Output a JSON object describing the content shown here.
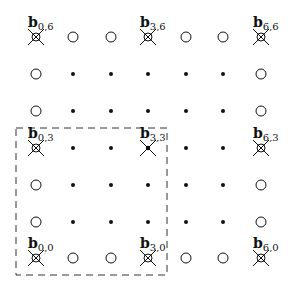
{
  "diagram": {
    "grid": {
      "cols": 7,
      "rows": 7,
      "x_positions": [
        36,
        73,
        111,
        148,
        186,
        223,
        261
      ],
      "y_positions": [
        37,
        74,
        111,
        148,
        185,
        222,
        258
      ]
    },
    "legend_semantics": {
      "crossed_circle": "basis point b_{i,j} (corner, multiples of 3)",
      "crossed_dot": "basis point inside region",
      "open_circle": "boundary point",
      "dot": "interior point"
    },
    "points": [
      {
        "i": 0,
        "j": 6,
        "type": "crossed_circle",
        "label": "b",
        "sub": "0,6"
      },
      {
        "i": 1,
        "j": 6,
        "type": "open_circle"
      },
      {
        "i": 2,
        "j": 6,
        "type": "open_circle"
      },
      {
        "i": 3,
        "j": 6,
        "type": "crossed_circle",
        "label": "b",
        "sub": "3,6"
      },
      {
        "i": 4,
        "j": 6,
        "type": "open_circle"
      },
      {
        "i": 5,
        "j": 6,
        "type": "open_circle"
      },
      {
        "i": 6,
        "j": 6,
        "type": "crossed_circle",
        "label": "b",
        "sub": "6,6"
      },
      {
        "i": 0,
        "j": 5,
        "type": "open_circle"
      },
      {
        "i": 1,
        "j": 5,
        "type": "dot"
      },
      {
        "i": 2,
        "j": 5,
        "type": "dot"
      },
      {
        "i": 3,
        "j": 5,
        "type": "dot"
      },
      {
        "i": 4,
        "j": 5,
        "type": "dot"
      },
      {
        "i": 5,
        "j": 5,
        "type": "dot"
      },
      {
        "i": 6,
        "j": 5,
        "type": "open_circle"
      },
      {
        "i": 0,
        "j": 4,
        "type": "open_circle"
      },
      {
        "i": 1,
        "j": 4,
        "type": "dot"
      },
      {
        "i": 2,
        "j": 4,
        "type": "dot"
      },
      {
        "i": 3,
        "j": 4,
        "type": "dot"
      },
      {
        "i": 4,
        "j": 4,
        "type": "dot"
      },
      {
        "i": 5,
        "j": 4,
        "type": "dot"
      },
      {
        "i": 6,
        "j": 4,
        "type": "open_circle"
      },
      {
        "i": 0,
        "j": 3,
        "type": "crossed_circle",
        "label": "b",
        "sub": "0,3"
      },
      {
        "i": 1,
        "j": 3,
        "type": "dot"
      },
      {
        "i": 2,
        "j": 3,
        "type": "dot"
      },
      {
        "i": 3,
        "j": 3,
        "type": "crossed_dot",
        "label": "b",
        "sub": "3,3"
      },
      {
        "i": 4,
        "j": 3,
        "type": "dot"
      },
      {
        "i": 5,
        "j": 3,
        "type": "dot"
      },
      {
        "i": 6,
        "j": 3,
        "type": "crossed_circle",
        "label": "b",
        "sub": "6,3"
      },
      {
        "i": 0,
        "j": 2,
        "type": "open_circle"
      },
      {
        "i": 1,
        "j": 2,
        "type": "dot"
      },
      {
        "i": 2,
        "j": 2,
        "type": "dot"
      },
      {
        "i": 3,
        "j": 2,
        "type": "dot"
      },
      {
        "i": 4,
        "j": 2,
        "type": "dot"
      },
      {
        "i": 5,
        "j": 2,
        "type": "dot"
      },
      {
        "i": 6,
        "j": 2,
        "type": "open_circle"
      },
      {
        "i": 0,
        "j": 1,
        "type": "open_circle"
      },
      {
        "i": 1,
        "j": 1,
        "type": "dot"
      },
      {
        "i": 2,
        "j": 1,
        "type": "dot"
      },
      {
        "i": 3,
        "j": 1,
        "type": "dot"
      },
      {
        "i": 4,
        "j": 1,
        "type": "dot"
      },
      {
        "i": 5,
        "j": 1,
        "type": "dot"
      },
      {
        "i": 6,
        "j": 1,
        "type": "open_circle"
      },
      {
        "i": 0,
        "j": 0,
        "type": "crossed_circle",
        "label": "b",
        "sub": "0,0"
      },
      {
        "i": 1,
        "j": 0,
        "type": "open_circle"
      },
      {
        "i": 2,
        "j": 0,
        "type": "open_circle"
      },
      {
        "i": 3,
        "j": 0,
        "type": "crossed_circle",
        "label": "b",
        "sub": "3,0"
      },
      {
        "i": 4,
        "j": 0,
        "type": "open_circle"
      },
      {
        "i": 5,
        "j": 0,
        "type": "open_circle"
      },
      {
        "i": 6,
        "j": 0,
        "type": "crossed_circle",
        "label": "b",
        "sub": "6,0"
      }
    ],
    "dashed_box": {
      "x1": 16,
      "y1": 128,
      "x2": 167,
      "y2": 275
    },
    "colors": {
      "ink": "#111111",
      "dash": "#333333",
      "background": "#ffffff"
    }
  }
}
